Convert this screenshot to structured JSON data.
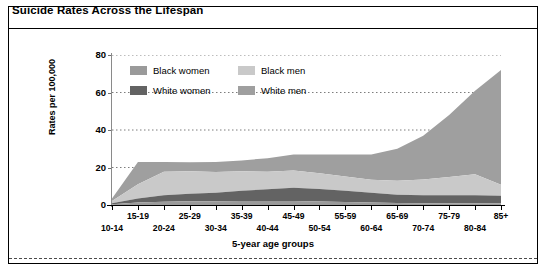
{
  "panel": {
    "title": "Suicide Rates Across the Lifespan"
  },
  "chart_data": {
    "type": "area",
    "stacked": true,
    "title": "Suicide Rates Across the Lifespan",
    "xlabel": "5-year age groups",
    "ylabel": "Rates per 100,000",
    "categories": [
      "10-14",
      "15-19",
      "20-24",
      "25-29",
      "30-34",
      "35-39",
      "40-44",
      "45-49",
      "50-54",
      "55-59",
      "60-64",
      "65-69",
      "70-74",
      "75-79",
      "80-84",
      "85+"
    ],
    "series": [
      {
        "name": "Black women",
        "color": "#9a9a9a",
        "values": [
          0.4,
          1.3,
          1.8,
          2.0,
          2.0,
          2.2,
          2.2,
          2.2,
          1.9,
          1.6,
          1.3,
          1.1,
          1.0,
          1.0,
          1.0,
          1.0
        ]
      },
      {
        "name": "White women",
        "color": "#636363",
        "values": [
          0.6,
          2.2,
          3.4,
          4.0,
          4.6,
          5.4,
          6.2,
          7.0,
          6.6,
          6.0,
          5.2,
          4.4,
          4.2,
          4.2,
          4.2,
          4.0
        ]
      },
      {
        "name": "Black men",
        "color": "#c9c9c9",
        "values": [
          1.2,
          7.6,
          12.6,
          12.0,
          11.0,
          10.4,
          9.4,
          9.2,
          8.4,
          7.6,
          7.0,
          7.4,
          8.4,
          9.8,
          11.2,
          5.8
        ]
      },
      {
        "name": "White men",
        "color": "#9f9f9f",
        "values": [
          1.3,
          11.9,
          5.2,
          4.8,
          5.4,
          5.8,
          7.2,
          8.6,
          10.1,
          11.8,
          13.5,
          17.1,
          23.4,
          33.0,
          44.6,
          61.2
        ]
      }
    ],
    "totals": [
      3.5,
      23.0,
      23.0,
      22.8,
      23.0,
      23.8,
      25.0,
      27.0,
      27.0,
      27.0,
      27.0,
      30.0,
      37.0,
      48.0,
      61.0,
      72.0
    ],
    "yticks": [
      0,
      20,
      40,
      60,
      80
    ],
    "ylim": [
      0,
      80
    ],
    "grid": "dotted-horizontal",
    "legend_position": "top-left-inside",
    "legend_entries": [
      {
        "label": "Black women",
        "color": "#9a9a9a"
      },
      {
        "label": "Black men",
        "color": "#c9c9c9"
      },
      {
        "label": "White women",
        "color": "#636363"
      },
      {
        "label": "White men",
        "color": "#9f9f9f"
      }
    ]
  }
}
